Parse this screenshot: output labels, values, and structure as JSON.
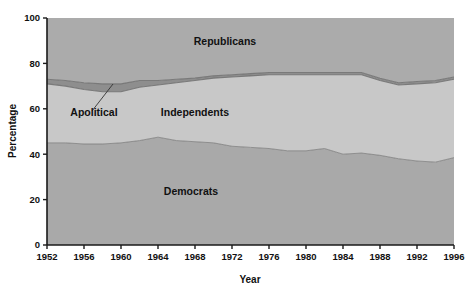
{
  "chart_data": {
    "type": "area",
    "stacked": true,
    "title": "",
    "subtitle": "",
    "xlabel": "Year",
    "ylabel": "Percentage",
    "xlim": [
      1952,
      1996
    ],
    "ylim": [
      0,
      100
    ],
    "grid": false,
    "legend_position": "inline-annotations",
    "x_tick_labels": [
      "1952",
      "1956",
      "1960",
      "1964",
      "1968",
      "1972",
      "1976",
      "1980",
      "1984",
      "1988",
      "1992",
      "1996"
    ],
    "x_ticks": [
      1952,
      1956,
      1960,
      1964,
      1968,
      1972,
      1976,
      1980,
      1984,
      1988,
      1992,
      1996
    ],
    "y_tick_labels": [
      "0",
      "20",
      "40",
      "60",
      "80",
      "100"
    ],
    "y_ticks": [
      0,
      20,
      40,
      60,
      80,
      100
    ],
    "x": [
      1952,
      1954,
      1956,
      1958,
      1960,
      1962,
      1964,
      1966,
      1968,
      1970,
      1972,
      1974,
      1976,
      1978,
      1980,
      1982,
      1984,
      1986,
      1988,
      1990,
      1992,
      1994,
      1996
    ],
    "series": [
      {
        "name": "Democrats",
        "color": "#a9a9a9",
        "values": [
          45.0,
          45.0,
          44.5,
          44.5,
          45.0,
          46.0,
          47.5,
          46.0,
          45.5,
          45.0,
          43.5,
          43.0,
          42.5,
          41.5,
          41.5,
          42.5,
          40.0,
          40.5,
          39.5,
          38.0,
          37.0,
          36.5,
          38.5
        ]
      },
      {
        "name": "Independents",
        "color": "#c8c8c8",
        "values": [
          26.0,
          25.0,
          24.0,
          23.0,
          22.5,
          23.5,
          23.0,
          25.5,
          27.0,
          28.5,
          30.5,
          31.5,
          32.5,
          33.5,
          33.5,
          32.5,
          35.0,
          34.5,
          33.0,
          32.5,
          34.0,
          35.0,
          34.5
        ]
      },
      {
        "name": "Apolitical",
        "color": "#8e8e8e",
        "values": [
          2.0,
          2.5,
          3.0,
          3.5,
          3.5,
          3.0,
          2.0,
          1.5,
          1.0,
          1.0,
          1.0,
          1.0,
          1.0,
          1.0,
          1.0,
          1.0,
          1.0,
          1.0,
          1.0,
          1.0,
          1.0,
          1.0,
          1.0
        ]
      },
      {
        "name": "Republicans",
        "color": "#ababab",
        "values": [
          27.0,
          27.5,
          28.5,
          29.0,
          29.0,
          27.5,
          27.5,
          27.0,
          26.5,
          25.5,
          25.0,
          24.5,
          24.0,
          24.0,
          24.0,
          24.0,
          24.0,
          24.0,
          26.5,
          28.5,
          28.0,
          27.5,
          26.0
        ]
      }
    ],
    "series_labels": [
      {
        "name": "Republicans",
        "text": "Republicans",
        "x_px": 225,
        "y_px": 45
      },
      {
        "name": "Independents",
        "text": "Independents",
        "x_px": 195,
        "y_px": 116
      },
      {
        "name": "Democrats",
        "text": "Democrats",
        "x_px": 191,
        "y_px": 195
      }
    ],
    "annotations": [
      {
        "name": "apolitical",
        "text": "Apolitical",
        "label_x_px": 94,
        "label_y_px": 116,
        "leader_from_x_px": 92,
        "leader_from_y_px": 111,
        "leader_to_x_px": 113,
        "leader_to_y_px": 84
      }
    ]
  },
  "axes": {
    "y_title": "Percentage",
    "x_title": "Year"
  },
  "colors": {
    "democrats": "#a9a9a9",
    "independents": "#c8c8c8",
    "apolitical": "#8e8e8e",
    "republicans": "#ababab",
    "axis": "#1a1a1a",
    "outline": "#6f6f6f",
    "background": "#ffffff"
  }
}
